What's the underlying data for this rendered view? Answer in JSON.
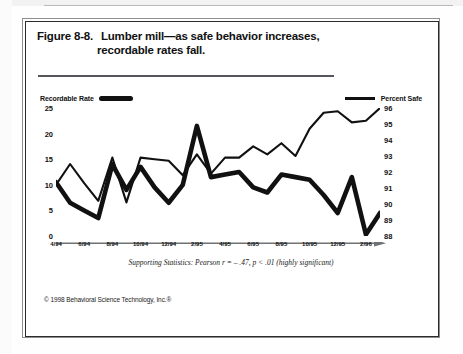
{
  "figure": {
    "label": "Figure 8-8.",
    "title_line1": "Lumber mill—as safe behavior increases,",
    "title_line2": "recordable rates fall."
  },
  "legend": {
    "left_label": "Recordable Rate",
    "right_label": "Percent Safe",
    "left_swatch": "thick-line-swatch",
    "right_swatch": "thin-line-swatch"
  },
  "footnote": "Supporting Statistics: Pearson  r = – .47, p < .01 (highly significant)",
  "copyright": "© 1998 Behavioral Science Technology, Inc.®",
  "colors": {
    "ink": "#111111",
    "rule": "#55575a",
    "frame": "#2b2b2b",
    "paper": "#ffffff"
  },
  "chart_data": {
    "type": "line",
    "title": "Lumber mill—as safe behavior increases, recordable rates fall.",
    "xlabel": "",
    "ylabel": "",
    "grid": false,
    "legend_position": "top",
    "x": [
      "4/94",
      "5/94",
      "6/94",
      "7/94",
      "8/94",
      "9/94",
      "10/94",
      "11/94",
      "12/94",
      "1/95",
      "2/95",
      "3/95",
      "4/95",
      "5/95",
      "6/95",
      "7/95",
      "8/95",
      "9/95",
      "10/95",
      "11/95",
      "12/95",
      "1/96",
      "2/96",
      "3/96"
    ],
    "xticklabels": [
      "4/94",
      "6/94",
      "8/94",
      "10/94",
      "12/94",
      "2/95",
      "4/95",
      "6/95",
      "8/95",
      "10/95",
      "12/95",
      "2/96"
    ],
    "axes": [
      {
        "name": "left",
        "label": "Recordable Rate",
        "ticks": [
          0,
          5,
          10,
          15,
          20,
          25
        ],
        "ylim": [
          0,
          25
        ]
      },
      {
        "name": "right",
        "label": "Percent Safe",
        "ticks": [
          88,
          89,
          90,
          91,
          92,
          93,
          94,
          95,
          96
        ],
        "ylim": [
          88,
          96
        ]
      }
    ],
    "series": [
      {
        "name": "Recordable Rate",
        "axis": "left",
        "style": "thick",
        "values": [
          10.5,
          6.5,
          5.0,
          3.5,
          14.0,
          9.0,
          13.5,
          9.5,
          6.5,
          10.0,
          21.5,
          11.5,
          12.0,
          12.5,
          9.5,
          8.5,
          12.0,
          11.5,
          11.0,
          8.0,
          4.5,
          11.5,
          0.3,
          4.5
        ]
      },
      {
        "name": "Percent Safe",
        "axis": "right",
        "style": "thin",
        "values": [
          91.2,
          92.5,
          91.3,
          90.2,
          92.9,
          90.1,
          92.9,
          92.8,
          92.7,
          91.8,
          93.1,
          91.9,
          92.9,
          92.9,
          93.6,
          93.1,
          93.8,
          93.0,
          94.7,
          95.7,
          95.8,
          95.1,
          95.2,
          96.0
        ]
      }
    ]
  }
}
